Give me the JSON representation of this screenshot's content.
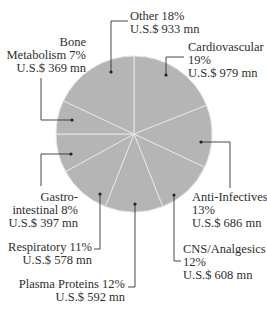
{
  "chart_data": {
    "type": "pie",
    "title": "",
    "start_angle_deg": 0,
    "direction": "clockwise",
    "fill_color": "#b5b5b5",
    "separator_color": "#e4e4e4",
    "text_color": "#2e2e2e",
    "slices": [
      {
        "name": "Cardiovascular",
        "percent": 19,
        "value_label": "U.S.$ 979 mn",
        "value": 979
      },
      {
        "name": "Anti-Infectives",
        "percent": 13,
        "value_label": "U.S.$ 686 mn",
        "value": 686
      },
      {
        "name": "CNS/Analgesics",
        "percent": 12,
        "value_label": "U.S.$ 608 mn",
        "value": 608
      },
      {
        "name": "Plasma Proteins",
        "percent": 12,
        "value_label": "U.S.$ 592 mn",
        "value": 592
      },
      {
        "name": "Respiratory",
        "percent": 11,
        "value_label": "U.S.$ 578 mn",
        "value": 578
      },
      {
        "name": "Gastro-intestinal",
        "percent": 8,
        "value_label": "U.S.$ 397 mn",
        "value": 397
      },
      {
        "name": "Bone Metabolism",
        "percent": 7,
        "value_label": "U.S.$ 369 mn",
        "value": 369
      },
      {
        "name": "Other",
        "percent": 18,
        "value_label": "U.S.$ 933 mn",
        "value": 933
      }
    ]
  },
  "labels": {
    "other": {
      "l1": "Other  18%",
      "l2": "U.S.$ 933 mn"
    },
    "cardio": {
      "l1": "Cardiovascular",
      "l2": "19%",
      "l3": "U.S.$ 979 mn"
    },
    "bone": {
      "l1": "Bone",
      "l2": "Metabolism  7%",
      "l3": "U.S.$ 369 mn"
    },
    "anti": {
      "l1": "Anti-Infectives",
      "l2": "13%",
      "l3": "U.S.$ 686 mn"
    },
    "gastro": {
      "l1": "Gastro-",
      "l2": "intestinal  8%",
      "l3": "U.S.$ 397 mn"
    },
    "cns": {
      "l1": "CNS/Analgesics",
      "l2": "12%",
      "l3": "U.S.$ 608 mn"
    },
    "resp": {
      "l1": "Respiratory  11%",
      "l2": "U.S.$ 578 mn"
    },
    "plasma": {
      "l1": "Plasma Proteins  12%",
      "l2": "U.S.$ 592 mn"
    }
  }
}
